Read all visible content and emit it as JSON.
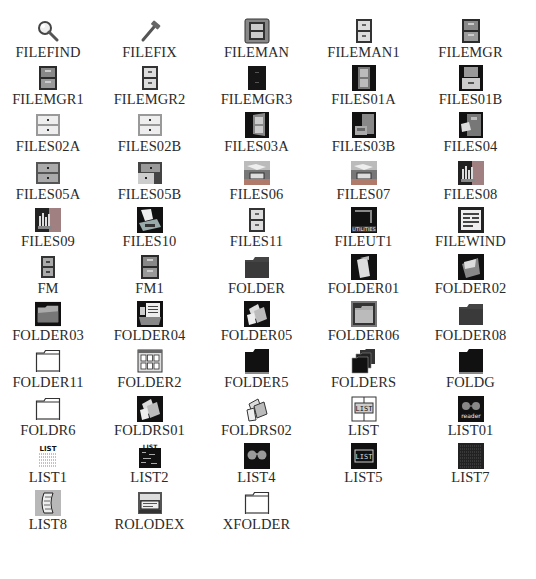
{
  "icons": [
    {
      "label": "FILEFIND",
      "icon": "magnifier-icon"
    },
    {
      "label": "FILEFIX",
      "icon": "hammer-icon"
    },
    {
      "label": "FILEMAN",
      "icon": "framed-cabinet-icon"
    },
    {
      "label": "FILEMAN1",
      "icon": "cabinet-light-icon"
    },
    {
      "label": "FILEMGR",
      "icon": "cabinet-dark-icon"
    },
    {
      "label": "FILEMGR1",
      "icon": "cabinet-dark-icon"
    },
    {
      "label": "FILEMGR2",
      "icon": "cabinet-light-icon"
    },
    {
      "label": "FILEMGR3",
      "icon": "cabinet-black-icon"
    },
    {
      "label": "FILES01A",
      "icon": "cabinet-on-black-icon"
    },
    {
      "label": "FILES01B",
      "icon": "cabinet-open-black-icon"
    },
    {
      "label": "FILES02A",
      "icon": "drawers-white-icon"
    },
    {
      "label": "FILES02B",
      "icon": "drawers-white-icon"
    },
    {
      "label": "FILES03A",
      "icon": "cabinet-angled-icon"
    },
    {
      "label": "FILES03B",
      "icon": "cabinet-open-drawer-icon"
    },
    {
      "label": "FILES04",
      "icon": "cabinet-files-out-icon"
    },
    {
      "label": "FILES05A",
      "icon": "drawers-gray-icon"
    },
    {
      "label": "FILES05B",
      "icon": "drawers-gray-open-icon"
    },
    {
      "label": "FILES06",
      "icon": "file-tray-icon"
    },
    {
      "label": "FILES07",
      "icon": "file-tray-icon"
    },
    {
      "label": "FILES08",
      "icon": "file-bars-icon"
    },
    {
      "label": "FILES09",
      "icon": "file-bars-icon"
    },
    {
      "label": "FILES10",
      "icon": "hand-file-icon"
    },
    {
      "label": "FILES11",
      "icon": "cabinet-light-icon"
    },
    {
      "label": "FILEUT1",
      "icon": "utilities-icon"
    },
    {
      "label": "FILEWIND",
      "icon": "file-window-icon"
    },
    {
      "label": "FM",
      "icon": "cabinet-small-icon"
    },
    {
      "label": "FM1",
      "icon": "cabinet-dark-icon"
    },
    {
      "label": "FOLDER",
      "icon": "folder-dark-icon"
    },
    {
      "label": "FOLDER01",
      "icon": "folder-tilted-icon"
    },
    {
      "label": "FOLDER02",
      "icon": "folder-open-black-icon"
    },
    {
      "label": "FOLDER03",
      "icon": "folder-open-icon"
    },
    {
      "label": "FOLDER04",
      "icon": "folder-docs-icon"
    },
    {
      "label": "FOLDER05",
      "icon": "folders-stack-black-icon"
    },
    {
      "label": "FOLDER06",
      "icon": "folder-framed-icon"
    },
    {
      "label": "FOLDER08",
      "icon": "folder-dark-icon"
    },
    {
      "label": "FOLDER11",
      "icon": "folder-outline-icon"
    },
    {
      "label": "FOLDER2",
      "icon": "folder-grid-icon"
    },
    {
      "label": "FOLDER5",
      "icon": "folder-black-icon"
    },
    {
      "label": "FOLDERS",
      "icon": "folders-multiple-icon"
    },
    {
      "label": "FOLDG",
      "icon": "folder-black-icon"
    },
    {
      "label": "FOLDR6",
      "icon": "folder-outline-icon"
    },
    {
      "label": "FOLDRS01",
      "icon": "folders-stack-black-icon"
    },
    {
      "label": "FOLDRS02",
      "icon": "folders-stack-white-icon"
    },
    {
      "label": "LIST",
      "icon": "list-framed-icon"
    },
    {
      "label": "LIST01",
      "icon": "list-reader-icon"
    },
    {
      "label": "LIST1",
      "icon": "list-text-icon"
    },
    {
      "label": "LIST2",
      "icon": "list-dark-icon"
    },
    {
      "label": "LIST4",
      "icon": "list-glasses-icon"
    },
    {
      "label": "LIST5",
      "icon": "list-screen-icon"
    },
    {
      "label": "LIST7",
      "icon": "list-dense-icon"
    },
    {
      "label": "LIST8",
      "icon": "list-scroll-icon"
    },
    {
      "label": "ROLODEX",
      "icon": "rolodex-icon"
    },
    {
      "label": "XFOLDER",
      "icon": "folder-outline-icon"
    }
  ],
  "colors": {
    "label": "#2a2a2a",
    "background": "#ffffff",
    "dark": "#1a1a1a",
    "cabinet_gray": "#8a8a8a",
    "drawer_light": "#d8d8d8",
    "accent_tray": "#b07060"
  }
}
